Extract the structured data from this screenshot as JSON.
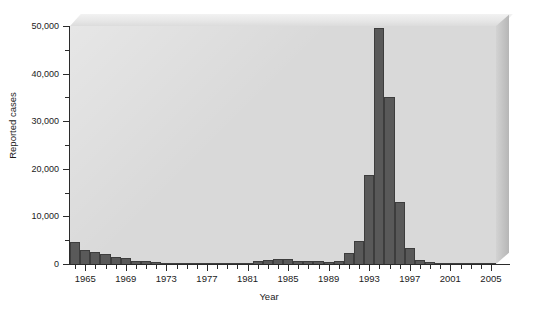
{
  "chart_data": {
    "type": "bar",
    "title": "",
    "xlabel": "Year",
    "ylabel": "Reported cases",
    "xlim": [
      1963.5,
      2005.5
    ],
    "ylim": [
      0,
      50000
    ],
    "grid": false,
    "legend": null,
    "bar_color": "#595959",
    "panel_color": "#d9d9d9",
    "ytick_labels": [
      "50,000",
      "40,000",
      "30,000",
      "20,000",
      "10,000",
      "0"
    ],
    "ytick_values": [
      50000,
      40000,
      30000,
      20000,
      10000,
      0
    ],
    "ytick_minor_values": [
      45000,
      35000,
      25000,
      15000,
      5000
    ],
    "xtick_labels": [
      "1965",
      "1969",
      "1973",
      "1977",
      "1981",
      "1985",
      "1989",
      "1993",
      "1997",
      "2001",
      "2005"
    ],
    "xtick_values": [
      1965,
      1969,
      1973,
      1977,
      1981,
      1985,
      1989,
      1993,
      1997,
      2001,
      2005
    ],
    "categories": [
      1964,
      1965,
      1966,
      1967,
      1968,
      1969,
      1970,
      1971,
      1972,
      1973,
      1974,
      1975,
      1976,
      1977,
      1978,
      1979,
      1980,
      1981,
      1982,
      1983,
      1984,
      1985,
      1986,
      1987,
      1988,
      1989,
      1990,
      1991,
      1992,
      1993,
      1994,
      1995,
      1996,
      1997,
      1998,
      1999,
      2000,
      2001,
      2002,
      2003,
      2004,
      2005
    ],
    "values": [
      4600,
      3000,
      2500,
      2200,
      1500,
      1300,
      700,
      600,
      400,
      250,
      180,
      150,
      120,
      100,
      90,
      100,
      150,
      300,
      600,
      900,
      1100,
      1000,
      600,
      650,
      600,
      450,
      700,
      2300,
      4900,
      18800,
      49600,
      35000,
      13000,
      3300,
      800,
      400,
      300,
      250,
      200,
      150,
      120,
      80
    ]
  }
}
